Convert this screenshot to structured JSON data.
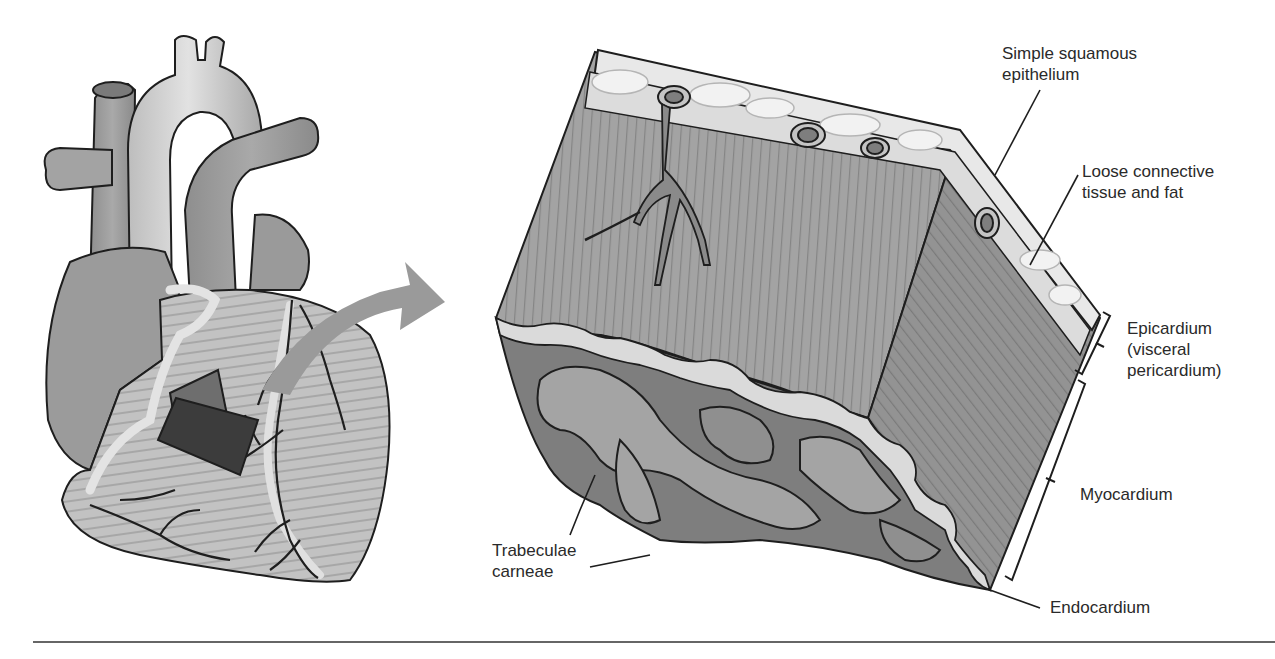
{
  "figure": {
    "left_panel": {
      "description": "Anterior view of heart with cut-out window",
      "callout": "cut-out-window",
      "arrow": "curved-arrow-right"
    },
    "right_panel": {
      "description": "Enlarged wedge section of heart wall"
    },
    "labels": {
      "simple_squamous_line1": "Simple squamous",
      "simple_squamous_line2": "epithelium",
      "loose_ct_line1": "Loose connective",
      "loose_ct_line2": "tissue and fat",
      "epicardium_line1": "Epicardium",
      "epicardium_line2": "(visceral",
      "epicardium_line3": "pericardium)",
      "myocardium": "Myocardium",
      "endocardium": "Endocardium",
      "trabeculae_line1": "Trabeculae",
      "trabeculae_line2": "carneae"
    },
    "colors": {
      "outline": "#1e1e1e",
      "vessel_light": "#c9c9c9",
      "vessel_mid": "#a9a9a9",
      "myocardium": "#9d9d9d",
      "myocardium_dark": "#8a8a8a",
      "fat": "#e6e6e6",
      "epithelium": "#ededed",
      "endocardium": "#d8d8d8",
      "trabeculae": "#a4a4a4",
      "cavity": "#7e7e7e",
      "window": "#3c3c3c",
      "arrow": "#9a9a9a",
      "rule": "#666666"
    }
  }
}
